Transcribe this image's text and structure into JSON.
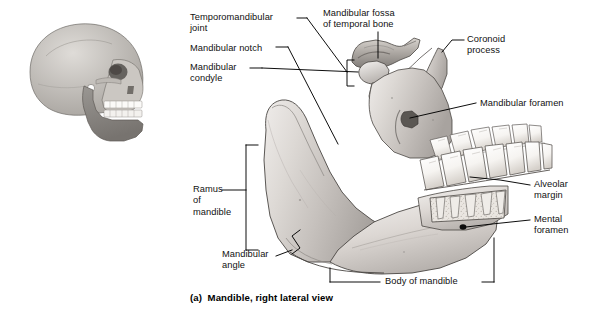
{
  "figure": {
    "caption": "(a)  Mandible, right lateral view",
    "view": "right lateral view",
    "inset": {
      "name": "skull-lateral-inset",
      "alt": "Lateral view of skull with mandible highlighted"
    }
  },
  "labels": [
    {
      "id": "temporomandibular-joint",
      "line1": "Temporomandibular",
      "line2": "joint",
      "x": 190,
      "y": 12,
      "align": "left"
    },
    {
      "id": "mandibular-notch",
      "line1": "Mandibular notch",
      "line2": "",
      "x": 190,
      "y": 43,
      "align": "left"
    },
    {
      "id": "mandibular-condyle",
      "line1": "Mandibular",
      "line2": "condyle",
      "x": 190,
      "y": 64,
      "align": "left"
    },
    {
      "id": "mandibular-fossa",
      "line1": "Mandibular fossa",
      "line2": "of temporal bone",
      "x": 323,
      "y": 8,
      "align": "left"
    },
    {
      "id": "coronoid-process",
      "line1": "Coronoid",
      "line2": "process",
      "x": 466,
      "y": 36,
      "align": "left"
    },
    {
      "id": "mandibular-foramen",
      "line1": "Mandibular foramen",
      "line2": "",
      "x": 478,
      "y": 98,
      "align": "left"
    },
    {
      "id": "alveolar-margin",
      "line1": "Alveolar",
      "line2": "margin",
      "x": 533,
      "y": 181,
      "align": "left"
    },
    {
      "id": "mental-foramen",
      "line1": "Mental",
      "line2": "foramen",
      "x": 533,
      "y": 216,
      "align": "left"
    },
    {
      "id": "ramus-of-mandible",
      "line1": "Ramus",
      "line2": "of",
      "line3": "mandible",
      "x": 193,
      "y": 184,
      "align": "left"
    },
    {
      "id": "mandibular-angle",
      "line1": "Mandibular",
      "line2": "angle",
      "x": 225,
      "y": 250,
      "align": "left"
    },
    {
      "id": "body-of-mandible",
      "line1": "Body of mandible",
      "line2": "",
      "x": 387,
      "y": 272,
      "align": "left"
    }
  ],
  "colors": {
    "bone_light": "#f2f0ee",
    "bone_mid": "#cfcbc6",
    "bone_dark": "#a9a4a0",
    "bone_shadow": "#8b8884",
    "tooth": "#fdfdfc",
    "tooth_shade": "#ded9d3",
    "outline": "#3d3a38",
    "leader": "#000000",
    "text": "#111111",
    "inset_cranium": "#c3c0bc",
    "inset_mandible": "#8d8a86",
    "marrow": "#e6e2dd"
  }
}
